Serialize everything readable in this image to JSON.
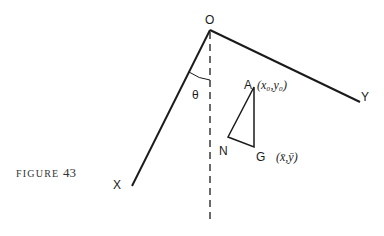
{
  "figure": {
    "caption_word": "FIGURE",
    "caption_number": "43",
    "labels": {
      "O": "O",
      "X": "X",
      "Y": "Y",
      "A": "A",
      "N": "N",
      "G": "G",
      "theta": "θ",
      "A_coords": "(x₀,y₀)",
      "G_coords": "(x̄,ȳ)"
    },
    "points": {
      "O": [
        210,
        30
      ],
      "X_end": [
        132,
        186
      ],
      "Y_end": [
        360,
        102
      ],
      "vertical_end": [
        210,
        222
      ],
      "A": [
        254,
        87
      ],
      "N": [
        228,
        137
      ],
      "G": [
        254,
        147
      ]
    },
    "colors": {
      "stroke": "#1a1a1a",
      "background": "#ffffff"
    }
  }
}
